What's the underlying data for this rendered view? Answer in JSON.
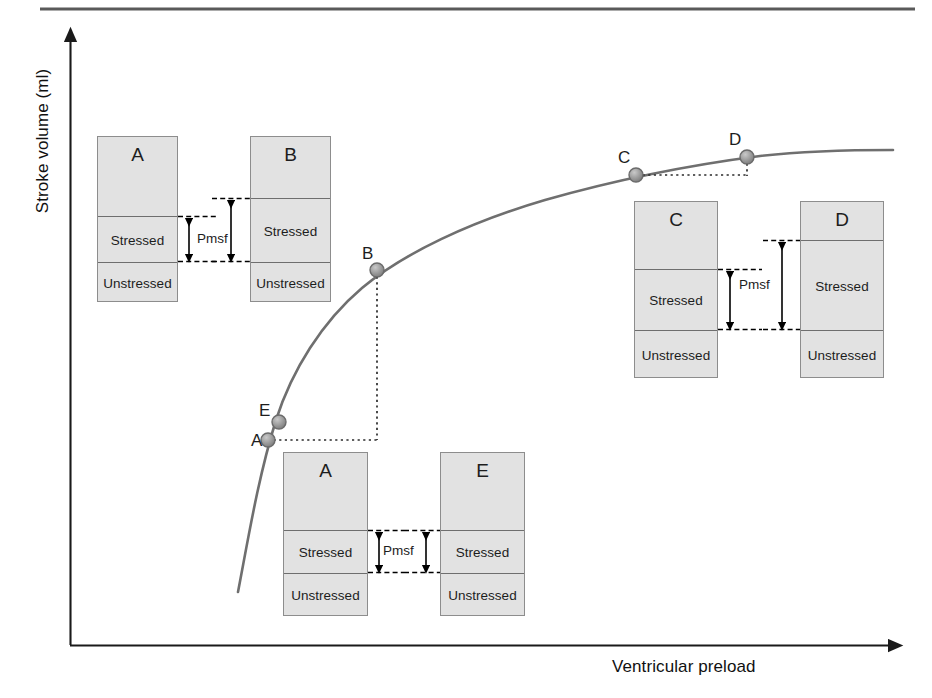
{
  "figure": {
    "top_rule": true,
    "axes": {
      "y_title": "Stroke volume (ml)",
      "x_title": "Ventricular preload"
    }
  },
  "curve_points": [
    {
      "id": "A",
      "label": "A",
      "x": 268,
      "y": 440
    },
    {
      "id": "E",
      "label": "E",
      "x": 279,
      "y": 422
    },
    {
      "id": "B",
      "label": "B",
      "x": 377,
      "y": 270
    },
    {
      "id": "C",
      "label": "C",
      "x": 636,
      "y": 175
    },
    {
      "id": "D",
      "label": "D",
      "x": 747,
      "y": 157
    }
  ],
  "point_labels": [
    {
      "text": "A",
      "x": 251,
      "y": 432
    },
    {
      "text": "E",
      "x": 259,
      "y": 402
    },
    {
      "text": "B",
      "x": 362,
      "y": 245
    },
    {
      "text": "C",
      "x": 618,
      "y": 149
    },
    {
      "text": "D",
      "x": 729,
      "y": 131
    }
  ],
  "compartment_boxes": [
    {
      "id": "box-a-top",
      "title": "A",
      "stressed_label": "Stressed",
      "unstressed_label": "Unstressed",
      "x": 97,
      "y": 136,
      "w": 81,
      "h": 166,
      "stressed_top": 216,
      "stressed_bottom": 262
    },
    {
      "id": "box-b-top",
      "title": "B",
      "stressed_label": "Stressed",
      "unstressed_label": "Unstressed",
      "x": 250,
      "y": 136,
      "w": 81,
      "h": 166,
      "stressed_top": 198,
      "stressed_bottom": 262
    },
    {
      "id": "box-c",
      "title": "C",
      "stressed_label": "Stressed",
      "unstressed_label": "Unstressed",
      "x": 634,
      "y": 201,
      "w": 84,
      "h": 177,
      "stressed_top": 269,
      "stressed_bottom": 330
    },
    {
      "id": "box-d",
      "title": "D",
      "stressed_label": "Stressed",
      "unstressed_label": "Unstressed",
      "x": 800,
      "y": 201,
      "w": 84,
      "h": 177,
      "stressed_top": 240,
      "stressed_bottom": 330
    },
    {
      "id": "box-a-bottom",
      "title": "A",
      "stressed_label": "Stressed",
      "unstressed_label": "Unstressed",
      "x": 283,
      "y": 452,
      "w": 85,
      "h": 164,
      "stressed_top": 530,
      "stressed_bottom": 573
    },
    {
      "id": "box-e-bottom",
      "title": "E",
      "stressed_label": "Stressed",
      "unstressed_label": "Unstressed",
      "x": 440,
      "y": 452,
      "w": 85,
      "h": 164,
      "stressed_top": 530,
      "stressed_bottom": 573
    }
  ],
  "pmsf_annotations": [
    {
      "id": "pmsf-ab",
      "label": "Pmsf",
      "label_x": 197,
      "label_y": 232
    },
    {
      "id": "pmsf-cd",
      "label": "Pmsf",
      "label_x": 739,
      "label_y": 278
    },
    {
      "id": "pmsf-ae",
      "label": "Pmsf",
      "label_x": 383,
      "label_y": 544
    }
  ],
  "chart_data": {
    "type": "line",
    "title": "",
    "xlabel": "Ventricular preload",
    "ylabel": "Stroke volume (ml)",
    "grid": false,
    "legend": "none",
    "series": [
      {
        "name": "Frank-Starling curve",
        "color": "#6f6f6f",
        "points_px": [
          [
            238,
            592
          ],
          [
            244,
            560
          ],
          [
            251,
            525
          ],
          [
            258,
            492
          ],
          [
            266,
            455
          ],
          [
            276,
            420
          ],
          [
            290,
            382
          ],
          [
            308,
            345
          ],
          [
            330,
            312
          ],
          [
            355,
            287
          ],
          [
            380,
            268
          ],
          [
            410,
            250
          ],
          [
            445,
            234
          ],
          [
            485,
            219
          ],
          [
            530,
            205
          ],
          [
            580,
            192
          ],
          [
            636,
            175
          ],
          [
            690,
            166
          ],
          [
            747,
            157
          ],
          [
            800,
            153
          ],
          [
            860,
            151
          ],
          [
            893,
            151
          ]
        ]
      }
    ],
    "marked_points": [
      {
        "label": "A",
        "preload": "low",
        "stroke_volume": "low",
        "px": [
          268,
          440
        ]
      },
      {
        "label": "E",
        "preload": "low",
        "stroke_volume": "low",
        "px": [
          279,
          422
        ]
      },
      {
        "label": "B",
        "preload": "mid",
        "stroke_volume": "mid",
        "px": [
          377,
          270
        ]
      },
      {
        "label": "C",
        "preload": "high",
        "stroke_volume": "near-plateau",
        "px": [
          636,
          175
        ]
      },
      {
        "label": "D",
        "preload": "very high",
        "stroke_volume": "plateau",
        "px": [
          747,
          157
        ]
      }
    ],
    "axis_style": {
      "y_arrow": true,
      "x_arrow": true,
      "ticks": false
    }
  }
}
